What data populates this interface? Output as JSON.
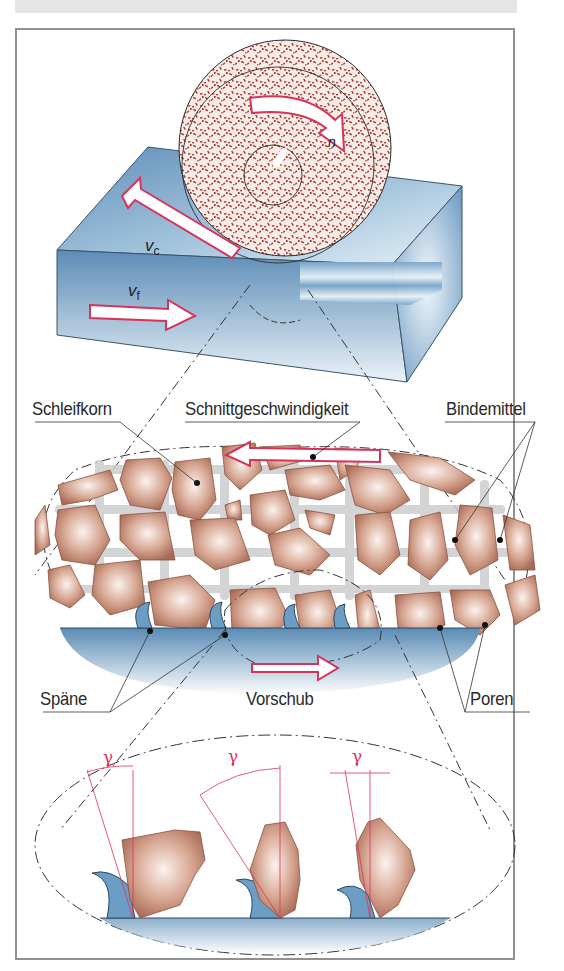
{
  "figure": {
    "header_bar_color": "#e3e5e6",
    "frame_border_color": "#8e9194",
    "colors": {
      "arrow_outline": "#d6335a",
      "workpiece_blue": "#6f9ec4",
      "grain_brown": "#b07a62",
      "bond_gray": "#c8cacb",
      "angle_red": "#e0305a"
    }
  },
  "top_view": {
    "symbols": {
      "cutting_speed": "v",
      "cutting_speed_sub": "c",
      "feed": "v",
      "feed_sub": "f",
      "rotation": "n"
    }
  },
  "labels": {
    "grain": "Schleifkorn",
    "cutting_speed": "Schnittgeschwindigkeit",
    "bond": "Bindemittel",
    "chips": "Späne",
    "feed": "Vorschub",
    "pores": "Poren"
  },
  "detail_view": {
    "angle_symbol": "γ",
    "angle_count": 3
  }
}
